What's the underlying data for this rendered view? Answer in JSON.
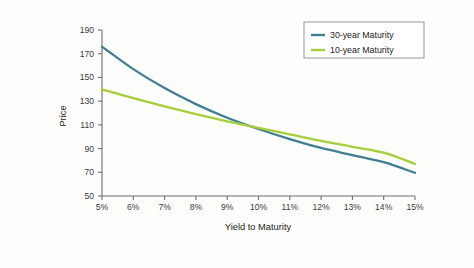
{
  "chart_data": {
    "type": "line",
    "title": "",
    "xlabel": "Yield to Maturity",
    "ylabel": "Price",
    "xlim": [
      5,
      15
    ],
    "ylim": [
      50,
      190
    ],
    "grid": false,
    "legend_position": "top-right",
    "x": [
      5,
      6,
      7,
      8,
      9,
      10,
      11,
      12,
      13,
      14,
      15
    ],
    "xticklabels": [
      "5%",
      "6%",
      "7%",
      "8%",
      "9%",
      "10%",
      "11%",
      "12%",
      "13%",
      "14%",
      "15%"
    ],
    "yticks": [
      50,
      70,
      90,
      110,
      130,
      150,
      170,
      190
    ],
    "yticklabels": [
      "50",
      "70",
      "90",
      "110",
      "130",
      "150",
      "170",
      "190"
    ],
    "series": [
      {
        "name": "30-year Maturity",
        "color": "#3f7f93",
        "values": [
          176.0,
          157.0,
          141.0,
          127.5,
          116.0,
          106.5,
          98.0,
          90.5,
          84.5,
          78.5,
          69.5
        ]
      },
      {
        "name": "10-year Maturity",
        "color": "#a6ce39",
        "values": [
          140.0,
          132.5,
          125.5,
          119.0,
          113.0,
          107.5,
          102.0,
          96.5,
          91.5,
          86.5,
          77.0
        ]
      }
    ]
  },
  "legend": {
    "entries": [
      {
        "label": "30-year Maturity",
        "color": "#3f7f93"
      },
      {
        "label": "10-year Maturity",
        "color": "#a6ce39"
      }
    ]
  },
  "axes": {
    "x_title": "Yield to Maturity",
    "y_title": "Price"
  }
}
